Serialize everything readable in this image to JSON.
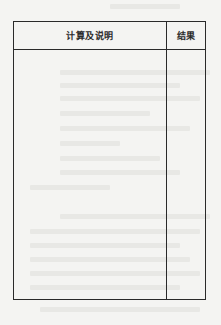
{
  "document": {
    "type": "calculation-sheet-form",
    "table": {
      "columns": [
        {
          "label": "计算及说明"
        },
        {
          "label": "结果"
        }
      ],
      "rows": []
    }
  }
}
